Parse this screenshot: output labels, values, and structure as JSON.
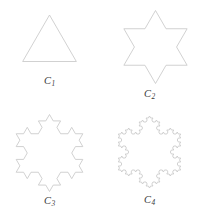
{
  "figure": {
    "background_color": "#ffffff",
    "stroke_color": "#c9c9c9",
    "label_color": "#3a3a3a"
  },
  "panels": [
    {
      "id": "c1",
      "label_base": "C",
      "label_subscript": "1",
      "label_text": "C1",
      "shape_name": "equilateral-triangle",
      "iteration": 0,
      "sides": 3,
      "center_x": 49.5,
      "center_y": 46.0,
      "radius": 31.0,
      "rotation_deg": -90
    },
    {
      "id": "c2",
      "label_base": "C",
      "label_subscript": "2",
      "label_text": "C2",
      "shape_name": "six-pointed-star",
      "iteration": 1,
      "sides": 3,
      "center_x": 55.5,
      "center_y": 47.0,
      "radius": 36.5,
      "rotation_deg": -90
    },
    {
      "id": "c3",
      "label_base": "C",
      "label_subscript": "3",
      "label_text": "C3",
      "shape_name": "koch-snowflake-stage-3",
      "iteration": 2,
      "sides": 3,
      "center_x": 49.5,
      "center_y": 48.0,
      "radius": 38.5,
      "rotation_deg": -90
    },
    {
      "id": "c4",
      "label_base": "C",
      "label_subscript": "4",
      "label_text": "C4",
      "shape_name": "koch-snowflake-stage-4",
      "iteration": 3,
      "sides": 3,
      "center_x": 49.5,
      "center_y": 47.0,
      "radius": 36.0,
      "rotation_deg": -90
    }
  ]
}
